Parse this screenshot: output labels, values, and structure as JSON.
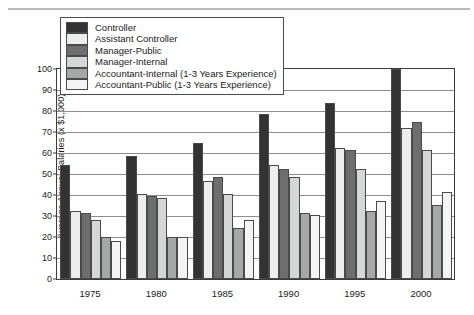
{
  "chart_data": {
    "type": "bar",
    "title": "",
    "xlabel": "",
    "ylabel": "Average Annual Salaries (x $1,000)",
    "categories": [
      "1975",
      "1980",
      "1985",
      "1990",
      "1995",
      "2000"
    ],
    "ylim": [
      0,
      100
    ],
    "ytick_labels": [
      "0",
      "10",
      "20",
      "30",
      "40",
      "50",
      "60",
      "70",
      "80",
      "90",
      "100"
    ],
    "ytick_values": [
      0,
      10,
      20,
      30,
      40,
      50,
      60,
      70,
      80,
      90,
      100
    ],
    "grid": true,
    "legend_position": "upper-left",
    "series": [
      {
        "name": "Controller",
        "color": "#333333",
        "values": [
          54,
          58,
          64,
          78,
          83,
          99
        ]
      },
      {
        "name": "Assistant Controller",
        "color": "#eceded",
        "values": [
          32,
          40,
          46,
          54,
          62,
          71
        ]
      },
      {
        "name": "Manager-Public",
        "color": "#6e6e6e",
        "values": [
          31,
          39,
          48,
          52,
          61,
          74
        ]
      },
      {
        "name": "Manager-Internal",
        "color": "#d5d6d6",
        "values": [
          28,
          38,
          40,
          48,
          52,
          61
        ]
      },
      {
        "name": "Accountant-Internal (1-3 Years Experience)",
        "color": "#a6a7a7",
        "values": [
          20,
          20,
          24,
          31,
          32,
          35
        ]
      },
      {
        "name": "Accountant-Public (1-3 Years Experience)",
        "color": "#f4f4f4",
        "values": [
          18,
          20,
          28,
          30,
          37,
          41
        ]
      }
    ]
  },
  "legend": {
    "items": [
      {
        "label": "Controller",
        "color": "#333333"
      },
      {
        "label": "Assistant Controller",
        "color": "#eceded"
      },
      {
        "label": "Manager-Public",
        "color": "#6e6e6e"
      },
      {
        "label": "Manager-Internal",
        "color": "#d5d6d6"
      },
      {
        "label": "Accountant-Internal (1-3 Years Experience)",
        "color": "#a6a7a7"
      },
      {
        "label": "Accountant-Public (1-3 Years Experience)",
        "color": "#f4f4f4"
      }
    ]
  }
}
